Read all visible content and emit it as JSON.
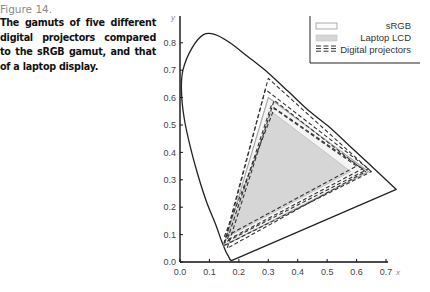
{
  "caption": {
    "label": "Figure 14.",
    "text": "The gamuts of five different digital projectors compared to the sRGB gamut, and that of a laptop display."
  },
  "colors": {
    "locus": "#222222",
    "srgb_fill": "#f4f4f4",
    "srgb_stroke": "#aaaaaa",
    "laptop_fill": "#d6d6d6",
    "projector_stroke": "#333333"
  },
  "chart_data": {
    "type": "scatter",
    "title": "",
    "subtitle": "CIE 1931 xy chromaticity diagram",
    "xlabel": "x",
    "ylabel": "y",
    "xlim": [
      0.0,
      0.75
    ],
    "ylim": [
      0.0,
      0.85
    ],
    "x_ticks": [
      "0.0",
      "0.1",
      "0.2",
      "0.3",
      "0.4",
      "0.5",
      "0.6",
      "0.7"
    ],
    "y_ticks": [
      "0.0",
      "0.1",
      "0.2",
      "0.3",
      "0.4",
      "0.5",
      "0.6",
      "0.7",
      "0.8"
    ],
    "grid": false,
    "legend_position": "upper right",
    "legend": [
      "sRGB",
      "Laptop LCD",
      "Digital projectors"
    ],
    "series": [
      {
        "name": "sRGB",
        "style": "solid light outline",
        "points": [
          [
            0.64,
            0.33
          ],
          [
            0.3,
            0.6
          ],
          [
            0.15,
            0.06
          ]
        ]
      },
      {
        "name": "Laptop LCD",
        "style": "grey fill",
        "points": [
          [
            0.58,
            0.33
          ],
          [
            0.31,
            0.55
          ],
          [
            0.16,
            0.09
          ]
        ]
      },
      {
        "name": "Projector 1",
        "style": "dashed",
        "points": [
          [
            0.65,
            0.33
          ],
          [
            0.3,
            0.67
          ],
          [
            0.15,
            0.06
          ]
        ]
      },
      {
        "name": "Projector 2",
        "style": "dashed",
        "points": [
          [
            0.64,
            0.34
          ],
          [
            0.29,
            0.63
          ],
          [
            0.15,
            0.07
          ]
        ]
      },
      {
        "name": "Projector 3",
        "style": "dashed",
        "points": [
          [
            0.63,
            0.33
          ],
          [
            0.32,
            0.59
          ],
          [
            0.16,
            0.05
          ]
        ]
      },
      {
        "name": "Projector 4",
        "style": "dashed",
        "points": [
          [
            0.62,
            0.34
          ],
          [
            0.31,
            0.57
          ],
          [
            0.16,
            0.08
          ]
        ]
      },
      {
        "name": "Projector 5",
        "style": "dashed",
        "points": [
          [
            0.6,
            0.35
          ],
          [
            0.32,
            0.56
          ],
          [
            0.15,
            0.09
          ]
        ]
      }
    ],
    "spectral_locus": [
      [
        0.175,
        0.005
      ],
      [
        0.17,
        0.009
      ],
      [
        0.165,
        0.02
      ],
      [
        0.155,
        0.04
      ],
      [
        0.14,
        0.08
      ],
      [
        0.12,
        0.14
      ],
      [
        0.09,
        0.22
      ],
      [
        0.06,
        0.32
      ],
      [
        0.035,
        0.42
      ],
      [
        0.015,
        0.52
      ],
      [
        0.005,
        0.62
      ],
      [
        0.01,
        0.7
      ],
      [
        0.04,
        0.78
      ],
      [
        0.08,
        0.83
      ],
      [
        0.12,
        0.83
      ],
      [
        0.17,
        0.8
      ],
      [
        0.23,
        0.75
      ],
      [
        0.3,
        0.69
      ],
      [
        0.37,
        0.62
      ],
      [
        0.44,
        0.55
      ],
      [
        0.51,
        0.49
      ],
      [
        0.58,
        0.42
      ],
      [
        0.65,
        0.35
      ],
      [
        0.735,
        0.265
      ]
    ]
  },
  "axes": {
    "x_ticks": [
      "0.0",
      "0.1",
      "0.2",
      "0.3",
      "0.4",
      "0.5",
      "0.6",
      "0.7"
    ],
    "y_ticks": [
      "0.0",
      "0.1",
      "0.2",
      "0.3",
      "0.4",
      "0.5",
      "0.6",
      "0.7",
      "0.8"
    ],
    "x_name": "x",
    "y_name": "y"
  },
  "legend": {
    "items": [
      "sRGB",
      "Laptop LCD",
      "Digital projectors"
    ]
  }
}
